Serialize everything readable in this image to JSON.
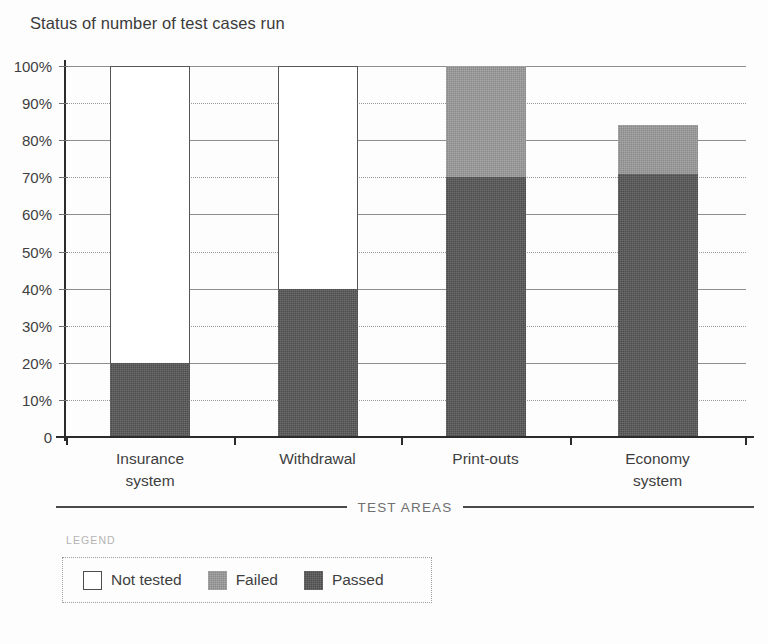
{
  "chart_data": {
    "type": "bar",
    "subtype": "stacked-percentage",
    "title": "Status of number of test cases run",
    "xlabel": "TEST AREAS",
    "ylabel": "",
    "categories": [
      "Insurance system",
      "Withdrawal",
      "Print-outs",
      "Economy system"
    ],
    "category_lines": [
      [
        "Insurance",
        "system"
      ],
      [
        "Withdrawal"
      ],
      [
        "Print-outs"
      ],
      [
        "Economy",
        "system"
      ]
    ],
    "series": [
      {
        "name": "Passed",
        "color": "#4d4d4d",
        "values": [
          20,
          40,
          70,
          71
        ]
      },
      {
        "name": "Failed",
        "color": "#8a8a8a",
        "values": [
          0,
          0,
          30,
          13
        ]
      },
      {
        "name": "Not tested",
        "color": "#ffffff",
        "values": [
          80,
          60,
          0,
          0
        ]
      }
    ],
    "stack_order": [
      "Passed",
      "Failed",
      "Not tested"
    ],
    "bar_totals": [
      100,
      100,
      100,
      84
    ],
    "ylim": [
      0,
      100
    ],
    "yticks": [
      0,
      10,
      20,
      30,
      40,
      50,
      60,
      70,
      80,
      90,
      100
    ],
    "ytick_labels": [
      "0",
      "10%",
      "20%",
      "30%",
      "40%",
      "50%",
      "60%",
      "70%",
      "80%",
      "90%",
      "100%"
    ],
    "grid": true,
    "grid_style": "dotted-horizontal",
    "legend_position": "bottom-left",
    "legend_caption": "LEGEND",
    "legend_entries": [
      {
        "label": "Not tested",
        "swatch": "nottested"
      },
      {
        "label": "Failed",
        "swatch": "failed"
      },
      {
        "label": "Passed",
        "swatch": "passed"
      }
    ]
  },
  "colors": {
    "passed": "#4d4d4d",
    "failed": "#8a8a8a",
    "not_tested": "#ffffff",
    "axis": "#2b2b2b",
    "grid": "#9a9a9a",
    "text": "#3f3f3f",
    "caption": "#b4b4b4",
    "background": "#fdfdfd"
  }
}
